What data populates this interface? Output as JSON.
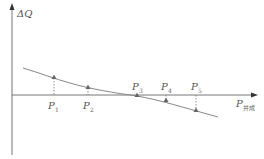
{
  "diagram": {
    "y_axis_label": "ΔQ",
    "x_axis_label": "P",
    "x_axis_subscript": "并成",
    "colors": {
      "axis": "#777777",
      "curve": "#888888",
      "marker": "#666666",
      "label": "#555555"
    },
    "points": [
      {
        "label": "P",
        "sub": "1",
        "position": "above-axis",
        "x": 54,
        "y": 78
      },
      {
        "label": "P",
        "sub": "2",
        "position": "above-axis",
        "x": 88,
        "y": 88
      },
      {
        "label": "P",
        "sub": "3",
        "position": "on-axis",
        "x": 137,
        "y": 96
      },
      {
        "label": "P",
        "sub": "4",
        "position": "below-axis",
        "x": 166,
        "y": 101
      },
      {
        "label": "P",
        "sub": "5",
        "position": "below-axis",
        "x": 196,
        "y": 111
      }
    ]
  }
}
